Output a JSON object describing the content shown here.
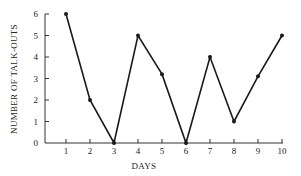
{
  "chart_data": {
    "type": "line",
    "title": "",
    "xlabel": "DAYS",
    "ylabel": "NUMBER OF TALK-OUTS",
    "x": [
      1,
      2,
      3,
      4,
      5,
      6,
      7,
      8,
      9,
      10
    ],
    "series": [
      {
        "name": "Talk-outs",
        "values": [
          6,
          2,
          0,
          5,
          3.2,
          0,
          4,
          1,
          3.1,
          5
        ]
      }
    ],
    "xticks": [
      1,
      2,
      3,
      4,
      5,
      6,
      7,
      8,
      9,
      10
    ],
    "yticks": [
      0,
      1,
      2,
      3,
      4,
      5,
      6
    ],
    "xlim": [
      0,
      10
    ],
    "ylim": [
      0,
      6
    ],
    "grid": false,
    "legend": null,
    "markers": true,
    "colors": {
      "line": "#1a1a1a",
      "axis": "#333333"
    }
  }
}
